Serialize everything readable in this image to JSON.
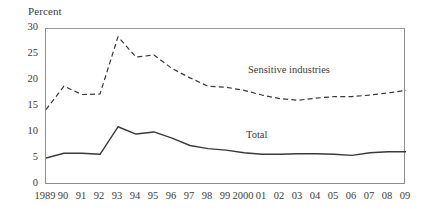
{
  "axis": {
    "y_title": "Percent",
    "y_ticks": [
      "30",
      "25",
      "20",
      "15",
      "10",
      "5",
      "0"
    ],
    "x_ticks": [
      "1989",
      "90",
      "91",
      "92",
      "93",
      "94",
      "95",
      "96",
      "97",
      "98",
      "99",
      "2000",
      "01",
      "02",
      "03",
      "04",
      "05",
      "06",
      "07",
      "08",
      "09"
    ]
  },
  "annotations": {
    "sensitive_industries": "Sensitive industries",
    "total": "Total"
  },
  "colors": {
    "line": "#3a3a3a",
    "frame": "#8e8e8e",
    "background": "#ffffff"
  },
  "chart_data": {
    "type": "line",
    "title": "",
    "xlabel": "",
    "ylabel": "Percent",
    "ylim": [
      0,
      30
    ],
    "ytick_step": 5,
    "grid": false,
    "legend": "inline-annotations",
    "categories": [
      "1989",
      "90",
      "91",
      "92",
      "93",
      "94",
      "95",
      "96",
      "97",
      "98",
      "99",
      "2000",
      "01",
      "02",
      "03",
      "04",
      "05",
      "06",
      "07",
      "08",
      "09"
    ],
    "series": [
      {
        "name": "Sensitive industries",
        "style": "dashed",
        "values": [
          14.5,
          19.0,
          17.4,
          17.5,
          28.5,
          24.6,
          25.0,
          22.4,
          20.6,
          19.0,
          18.8,
          18.2,
          17.3,
          16.6,
          16.3,
          16.7,
          17.0,
          17.0,
          17.3,
          17.7,
          18.2
        ]
      },
      {
        "name": "Total",
        "style": "solid",
        "values": [
          5.2,
          6.1,
          6.1,
          5.9,
          11.2,
          9.8,
          10.2,
          9.0,
          7.6,
          7.0,
          6.7,
          6.2,
          5.9,
          5.9,
          6.0,
          6.0,
          5.9,
          5.7,
          6.2,
          6.4,
          6.4
        ]
      }
    ]
  }
}
